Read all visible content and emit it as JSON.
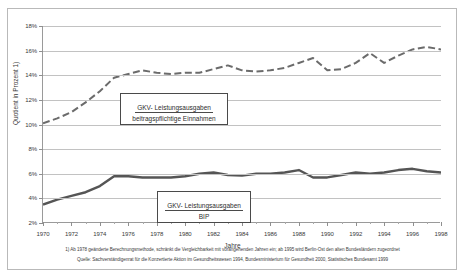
{
  "chart_data": {
    "type": "line",
    "title": "",
    "xlabel": "Jahre",
    "ylabel": "Quotient in Prozent 1)",
    "xlim": [
      1970,
      1998
    ],
    "ylim": [
      2,
      18
    ],
    "ytick_suffix": "%",
    "grid": true,
    "legend_position": "inside",
    "x": [
      1970,
      1971,
      1972,
      1973,
      1974,
      1975,
      1976,
      1977,
      1978,
      1979,
      1980,
      1981,
      1982,
      1983,
      1984,
      1985,
      1986,
      1987,
      1988,
      1989,
      1990,
      1991,
      1992,
      1993,
      1994,
      1995,
      1996,
      1997,
      1998
    ],
    "xticks": [
      "1970",
      "1972",
      "1974",
      "1976",
      "1978",
      "1980",
      "1982",
      "1984",
      "1986",
      "1988",
      "1990",
      "1992",
      "1994",
      "1996",
      "1998"
    ],
    "yticks": [
      "2%",
      "4%",
      "6%",
      "8%",
      "10%",
      "12%",
      "14%",
      "16%",
      "18%"
    ],
    "series": [
      {
        "name": "GKV- Leistungsausgaben / beitragspflichtige Einnahmen",
        "style": "dashed",
        "color": "#6b6b6b",
        "values": [
          10.1,
          10.5,
          11.0,
          11.8,
          12.7,
          13.8,
          14.1,
          14.4,
          14.2,
          14.1,
          14.2,
          14.2,
          14.5,
          14.8,
          14.4,
          14.3,
          14.4,
          14.6,
          15.0,
          15.4,
          14.4,
          14.5,
          15.0,
          15.8,
          15.0,
          15.6,
          16.1,
          16.3,
          16.1
        ]
      },
      {
        "name": "GKV- Leistungsausgaben / BIP",
        "style": "solid",
        "color": "#555555",
        "values": [
          3.5,
          3.9,
          4.2,
          4.5,
          5.0,
          5.8,
          5.8,
          5.7,
          5.7,
          5.7,
          5.8,
          6.0,
          6.1,
          5.9,
          5.85,
          6.0,
          6.0,
          6.1,
          6.3,
          5.7,
          5.7,
          5.9,
          6.1,
          6.0,
          6.1,
          6.3,
          6.4,
          6.2,
          6.1
        ]
      }
    ]
  },
  "axes": {
    "y_title": "Quotient in Prozent 1)",
    "x_title": "Jahre"
  },
  "legends": {
    "upper": {
      "numerator": "GKV- Leistungsausgaben",
      "denominator": "beitragspflichtige Einnahmen"
    },
    "lower": {
      "numerator": "GKV- Leistungsausgaben",
      "denominator": "BIP"
    }
  },
  "footnotes": {
    "line1": "1) Ab 1978 geänderte Berechnungsmethode, schränkt die Vergleichbarkeit mit vorangehenden Jahren ein; ab 1995 wird Berlin-Ost den alten Bundesländern zugeordnet",
    "line2": "Quelle: Sachverständigenrat für die Konzertierte Aktion im Gesundheitswesen 1994, Bundesministerium für Gesundheit 2000, Statistisches Bundesamt 1999"
  }
}
